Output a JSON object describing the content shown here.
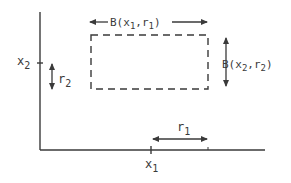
{
  "diagram": {
    "type": "product-neighborhood",
    "colors": {
      "stroke": "#3a3a3a",
      "background": "#ffffff"
    },
    "axes": {
      "x_tick_label": {
        "base": "x",
        "sub": "1"
      },
      "y_tick_label": {
        "base": "x",
        "sub": "2"
      }
    },
    "box": {
      "style": "dashed",
      "top_label": {
        "prefix": "B(x",
        "sub1": "1",
        "mid": ",r",
        "sub2": "1",
        "suffix": ")"
      },
      "right_label": {
        "prefix": "B(x",
        "sub1": "2",
        "mid": ",r",
        "sub2": "2",
        "suffix": ")"
      }
    },
    "radius_labels": {
      "r1": {
        "base": "r",
        "sub": "1"
      },
      "r2": {
        "base": "r",
        "sub": "2"
      }
    }
  }
}
